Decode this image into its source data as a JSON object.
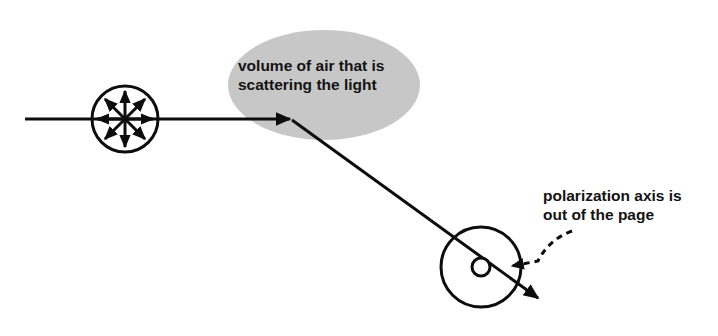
{
  "figure": {
    "background_color": "#ffffff",
    "ink_color": "#0d0d0d",
    "width": 718,
    "height": 336
  },
  "labels": {
    "volume": {
      "line1": "volume of air that is",
      "line2": "scattering the light",
      "x": 238,
      "y1": 71,
      "y2": 90
    },
    "polarization": {
      "line1": "polarization axis is",
      "line2": "out of the page",
      "x": 543,
      "y1": 201,
      "y2": 220
    }
  },
  "shapes": {
    "scattering_volume": {
      "name": "volume of air that is scattering the light",
      "type": "ellipse",
      "cx": 324,
      "cy": 85,
      "rx": 96,
      "ry": 55,
      "fill": "#c7c7c7"
    },
    "unpolarized_circle": {
      "name": "unpolarized light cross-section",
      "type": "circle",
      "cx": 125,
      "cy": 119,
      "r": 33,
      "stroke_width": 3
    },
    "polarized_circle": {
      "name": "polarized light cross-section",
      "type": "circle",
      "cx": 481,
      "cy": 267,
      "r": 40,
      "stroke_width": 3
    },
    "out_of_page_dot": {
      "name": "out-of-page polarization marker",
      "type": "circle",
      "cx": 481,
      "cy": 267,
      "r": 9,
      "stroke_width": 3,
      "fill": "#ffffff"
    }
  },
  "rays": {
    "incident": {
      "name": "incident unpolarized light ray",
      "x1": 25,
      "y1": 119,
      "x2": 297,
      "y2": 119,
      "stroke_width": 3,
      "arrowhead": "end"
    },
    "scattered": {
      "name": "scattered polarized light ray",
      "x1": 292,
      "y1": 120,
      "x2": 545,
      "y2": 303,
      "stroke_width": 3,
      "arrowhead": "end"
    }
  },
  "polarization_arrows": {
    "name": "radial oscillation directions of unpolarized light",
    "count": 4,
    "style": "double-headed",
    "length": 30,
    "angles_deg": [
      0,
      45,
      90,
      135
    ],
    "stroke_width": 3
  },
  "callout": {
    "name": "dashed pointer from polarization label to marker",
    "style": "dashed-curve",
    "dash": "6 5",
    "stroke_width": 3,
    "start_x": 572,
    "start_y": 231,
    "end_x": 505,
    "end_y": 266,
    "arrow_direction": "left"
  }
}
